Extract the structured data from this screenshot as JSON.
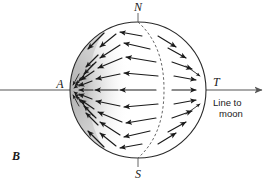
{
  "figure": {
    "panel_label": "B",
    "background_color": "#ffffff",
    "ink_color": "#1a1a1a",
    "shade_color": "#b9b9b9",
    "labels": {
      "north_pole": "N",
      "south_pole": "S",
      "sublunar_point": "A",
      "antipode_tangent": "T",
      "caption_line1": "Line to",
      "caption_line2": "moon"
    },
    "geometry": {
      "sphere_center_x": 138,
      "sphere_center_y": 90,
      "sphere_radius_x": 68,
      "sphere_radius_y": 68,
      "axis_y": 90,
      "axis_start_x": 0,
      "axis_end_x": 269,
      "terminator_dash": true
    },
    "vectors": {
      "description": "tidal acceleration arrows",
      "left_hemisphere_direction": "toward A",
      "right_hemisphere_direction": "toward T",
      "count_visible": 46
    }
  }
}
